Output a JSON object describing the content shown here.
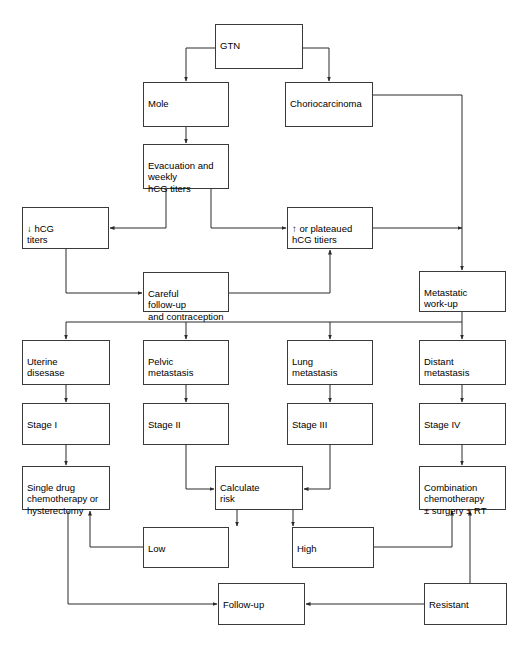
{
  "diagram": {
    "colors": {
      "box_border": "#3a3a3a",
      "line": "#2b2b2b",
      "background": "#ffffff",
      "text": "#000000"
    },
    "nodes": [
      {
        "id": "gtn",
        "label": "GTN",
        "x": 215,
        "y": 24,
        "w": 88,
        "h": 45
      },
      {
        "id": "mole",
        "label": "Mole",
        "x": 143,
        "y": 82,
        "w": 86,
        "h": 45
      },
      {
        "id": "chorio",
        "label": "Choriocarcinoma",
        "x": 285,
        "y": 82,
        "w": 88,
        "h": 45
      },
      {
        "id": "evacuation",
        "label": "Evacuation and\nweekly\nhCG titers",
        "x": 143,
        "y": 144,
        "w": 86,
        "h": 45
      },
      {
        "id": "hcg-down",
        "label": "↓ hCG\ntiters",
        "x": 22,
        "y": 207,
        "w": 87,
        "h": 42
      },
      {
        "id": "hcg-up",
        "label": "↑ or plateaued\nhCG titiers",
        "x": 287,
        "y": 207,
        "w": 86,
        "h": 42
      },
      {
        "id": "careful",
        "label": "Careful\nfollow-up\nand contraception",
        "x": 143,
        "y": 272,
        "w": 86,
        "h": 40
      },
      {
        "id": "metastatic",
        "label": "Metastatic\nwork-up",
        "x": 419,
        "y": 271,
        "w": 87,
        "h": 41
      },
      {
        "id": "uterine",
        "label": "Uterine\ndisesase",
        "x": 22,
        "y": 340,
        "w": 88,
        "h": 45
      },
      {
        "id": "pelvic",
        "label": "Pelvic\nmetastasis",
        "x": 143,
        "y": 340,
        "w": 86,
        "h": 45
      },
      {
        "id": "lung",
        "label": "Lung\nmetastasis",
        "x": 287,
        "y": 340,
        "w": 86,
        "h": 45
      },
      {
        "id": "distant",
        "label": "Distant\nmetastasis",
        "x": 419,
        "y": 340,
        "w": 87,
        "h": 45
      },
      {
        "id": "stage1",
        "label": "Stage I",
        "x": 22,
        "y": 403,
        "w": 88,
        "h": 42
      },
      {
        "id": "stage2",
        "label": "Stage II",
        "x": 143,
        "y": 403,
        "w": 86,
        "h": 42
      },
      {
        "id": "stage3",
        "label": "Stage III",
        "x": 287,
        "y": 403,
        "w": 86,
        "h": 42
      },
      {
        "id": "stage4",
        "label": "Stage IV",
        "x": 419,
        "y": 403,
        "w": 87,
        "h": 42
      },
      {
        "id": "single-drug",
        "label": "Single drug\nchemotherapy or\nhysterectomy",
        "x": 22,
        "y": 466,
        "w": 88,
        "h": 44
      },
      {
        "id": "calculate",
        "label": "Calculate\nrisk",
        "x": 215,
        "y": 466,
        "w": 88,
        "h": 44
      },
      {
        "id": "combination",
        "label": "Combination\nchemotherapy\n± surgery ± RT",
        "x": 419,
        "y": 466,
        "w": 87,
        "h": 44
      },
      {
        "id": "low",
        "label": "Low",
        "x": 143,
        "y": 527,
        "w": 86,
        "h": 41
      },
      {
        "id": "high",
        "label": "High",
        "x": 292,
        "y": 527,
        "w": 82,
        "h": 41
      },
      {
        "id": "followup",
        "label": "Follow-up",
        "x": 218,
        "y": 583,
        "w": 87,
        "h": 42
      },
      {
        "id": "resistant",
        "label": "Resistant",
        "x": 424,
        "y": 583,
        "w": 83,
        "h": 42
      }
    ],
    "edges": [
      {
        "from": "gtn",
        "to": "mole",
        "label": ""
      },
      {
        "from": "gtn",
        "to": "chorio",
        "label": ""
      },
      {
        "from": "mole",
        "to": "evacuation",
        "label": ""
      },
      {
        "from": "evacuation",
        "to": "hcg-down",
        "label": ""
      },
      {
        "from": "evacuation",
        "to": "hcg-up",
        "label": ""
      },
      {
        "from": "hcg-down",
        "to": "careful",
        "label": ""
      },
      {
        "from": "careful",
        "to": "hcg-up",
        "label": ""
      },
      {
        "from": "chorio",
        "to": "metastatic",
        "label": ""
      },
      {
        "from": "hcg-up",
        "to": "metastatic",
        "label": ""
      },
      {
        "from": "metastatic",
        "to": "uterine",
        "label": ""
      },
      {
        "from": "metastatic",
        "to": "pelvic",
        "label": ""
      },
      {
        "from": "metastatic",
        "to": "lung",
        "label": ""
      },
      {
        "from": "metastatic",
        "to": "distant",
        "label": ""
      },
      {
        "from": "uterine",
        "to": "stage1",
        "label": ""
      },
      {
        "from": "pelvic",
        "to": "stage2",
        "label": ""
      },
      {
        "from": "lung",
        "to": "stage3",
        "label": ""
      },
      {
        "from": "distant",
        "to": "stage4",
        "label": ""
      },
      {
        "from": "stage1",
        "to": "single-drug",
        "label": ""
      },
      {
        "from": "stage2",
        "to": "calculate",
        "label": ""
      },
      {
        "from": "stage3",
        "to": "calculate",
        "label": ""
      },
      {
        "from": "stage4",
        "to": "combination",
        "label": ""
      },
      {
        "from": "calculate",
        "to": "low",
        "label": ""
      },
      {
        "from": "calculate",
        "to": "high",
        "label": ""
      },
      {
        "from": "low",
        "to": "single-drug",
        "label": ""
      },
      {
        "from": "high",
        "to": "combination",
        "label": ""
      },
      {
        "from": "single-drug",
        "to": "followup",
        "label": ""
      },
      {
        "from": "resistant",
        "to": "followup",
        "label": ""
      },
      {
        "from": "resistant",
        "to": "combination",
        "label": ""
      }
    ]
  }
}
